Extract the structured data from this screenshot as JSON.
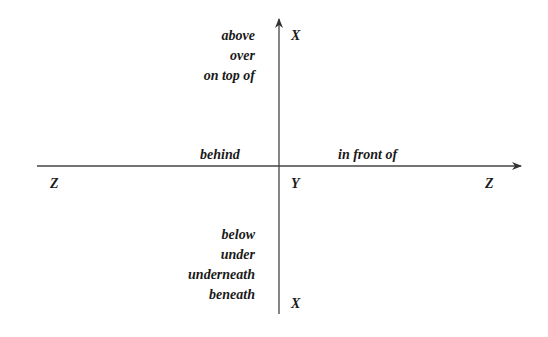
{
  "diagram": {
    "type": "spatial-prepositions-axes",
    "axes": {
      "vertical": {
        "top_label": "X",
        "bottom_label": "X"
      },
      "horizontal": {
        "left_label": "Z",
        "right_label": "Z"
      },
      "origin_label": "Y"
    },
    "upper_prepositions": [
      "above",
      "over",
      "on top of"
    ],
    "lower_prepositions": [
      "below",
      "under",
      "underneath",
      "beneath"
    ],
    "left_preposition": "behind",
    "right_preposition": "in front of"
  }
}
